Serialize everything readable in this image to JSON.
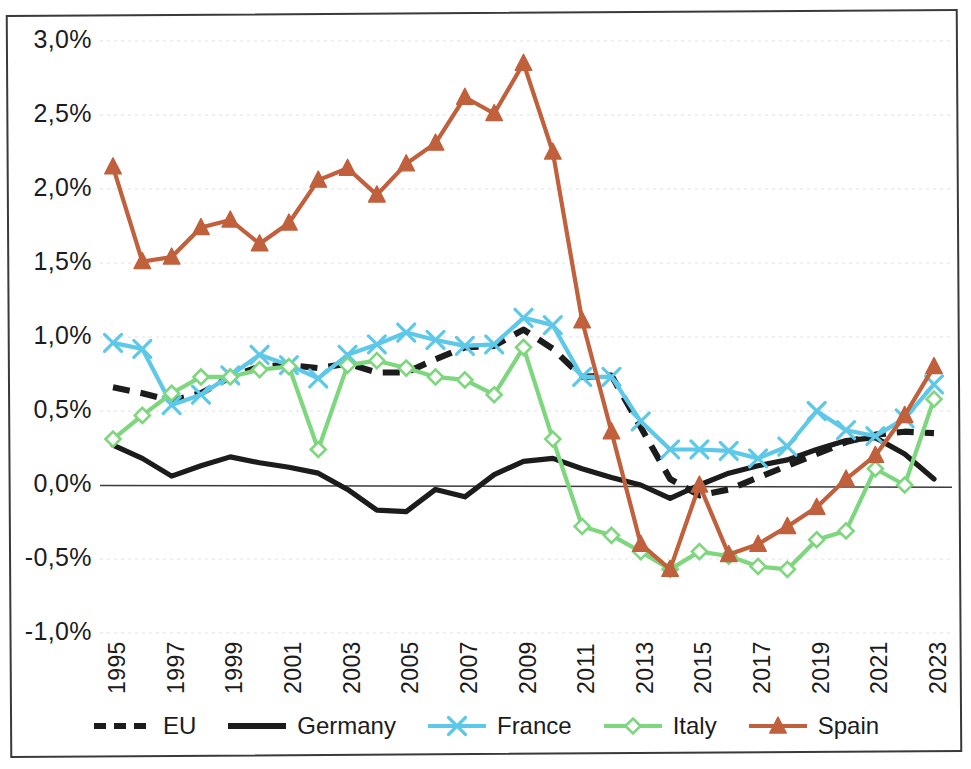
{
  "chart_data": {
    "type": "line",
    "title": "",
    "subtitle": "",
    "xlabel": "",
    "ylabel": "",
    "grid": true,
    "legend_position": "bottom",
    "xlim": [
      1995,
      2023
    ],
    "ylim": [
      -1.0,
      3.0
    ],
    "ytick_labels": [
      "3,0%",
      "2,5%",
      "2,0%",
      "1,5%",
      "1,0%",
      "0,5%",
      "0,0%",
      "-0,5%",
      "-1,0%"
    ],
    "ytick_values": [
      3.0,
      2.5,
      2.0,
      1.5,
      1.0,
      0.5,
      0.0,
      -0.5,
      -1.0
    ],
    "x": [
      1995,
      1996,
      1997,
      1998,
      1999,
      2000,
      2001,
      2002,
      2003,
      2004,
      2005,
      2006,
      2007,
      2008,
      2009,
      2010,
      2011,
      2012,
      2013,
      2014,
      2015,
      2016,
      2017,
      2018,
      2019,
      2020,
      2021,
      2022,
      2023
    ],
    "xtick_labels": [
      "1995",
      "1997",
      "1999",
      "2001",
      "2003",
      "2005",
      "2007",
      "2009",
      "2011",
      "2013",
      "2015",
      "2017",
      "2019",
      "2021",
      "2023"
    ],
    "xtick_values": [
      1995,
      1997,
      1999,
      2001,
      2003,
      2005,
      2007,
      2009,
      2011,
      2013,
      2015,
      2017,
      2019,
      2021,
      2023
    ],
    "series": [
      {
        "name": "EU",
        "color": "#1c1c1c",
        "style": "dashed",
        "marker": "none",
        "values": [
          0.66,
          0.62,
          0.57,
          0.62,
          0.73,
          0.8,
          0.81,
          0.79,
          0.82,
          0.76,
          0.76,
          0.85,
          0.93,
          0.94,
          1.05,
          0.92,
          0.73,
          0.74,
          0.39,
          0.04,
          -0.07,
          -0.03,
          0.05,
          0.13,
          0.21,
          0.29,
          0.34,
          0.36,
          0.35
        ]
      },
      {
        "name": "Germany",
        "color": "#1c1c1c",
        "style": "solid",
        "marker": "none",
        "values": [
          0.27,
          0.18,
          0.06,
          0.13,
          0.19,
          0.15,
          0.12,
          0.08,
          -0.03,
          -0.17,
          -0.18,
          -0.03,
          -0.08,
          0.07,
          0.16,
          0.18,
          0.11,
          0.05,
          0.0,
          -0.09,
          0.0,
          0.08,
          0.13,
          0.17,
          0.24,
          0.3,
          0.32,
          0.21,
          0.04
        ]
      },
      {
        "name": "France",
        "color": "#5ec8e8",
        "style": "solid",
        "marker": "x",
        "values": [
          0.96,
          0.92,
          0.54,
          0.61,
          0.74,
          0.88,
          0.81,
          0.72,
          0.88,
          0.95,
          1.03,
          0.98,
          0.94,
          0.95,
          1.13,
          1.08,
          0.73,
          0.73,
          0.43,
          0.24,
          0.24,
          0.23,
          0.18,
          0.26,
          0.5,
          0.37,
          0.33,
          0.45,
          0.68
        ]
      },
      {
        "name": "Italy",
        "color": "#7ed67e",
        "style": "solid",
        "marker": "diamond",
        "values": [
          0.31,
          0.47,
          0.62,
          0.73,
          0.73,
          0.78,
          0.8,
          0.24,
          0.81,
          0.84,
          0.79,
          0.73,
          0.71,
          0.61,
          0.93,
          0.31,
          -0.28,
          -0.34,
          -0.45,
          -0.57,
          -0.45,
          -0.48,
          -0.55,
          -0.57,
          -0.37,
          -0.31,
          0.11,
          0.0,
          0.58
        ]
      },
      {
        "name": "Spain",
        "color": "#c0603c",
        "style": "solid",
        "marker": "triangle",
        "values": [
          2.15,
          1.51,
          1.54,
          1.74,
          1.79,
          1.63,
          1.77,
          2.06,
          2.14,
          1.96,
          2.17,
          2.31,
          2.62,
          2.51,
          2.85,
          2.25,
          1.11,
          0.36,
          -0.4,
          -0.57,
          0.0,
          -0.47,
          -0.4,
          -0.28,
          -0.15,
          0.04,
          0.2,
          0.47,
          0.8
        ]
      }
    ]
  },
  "legend": {
    "items": [
      {
        "label": "EU"
      },
      {
        "label": "Germany"
      },
      {
        "label": "France"
      },
      {
        "label": "Italy"
      },
      {
        "label": "Spain"
      }
    ]
  }
}
